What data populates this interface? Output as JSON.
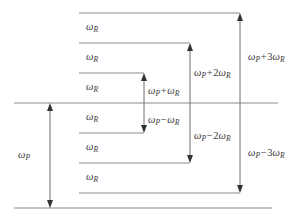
{
  "figure": {
    "type": "energy-level-diagram",
    "width": 302,
    "height": 220,
    "background_color": "#ffffff",
    "line_color": "#8c8c8c",
    "arrow_color": "#6e6e6e",
    "text_color": "#3a3a3a"
  },
  "symbols": {
    "omega": "ω",
    "sub_p": "P",
    "sub_r": "R",
    "plus": "+",
    "minus": "−"
  },
  "levels": [
    {
      "id": "level-p-plus-3r",
      "y": 13,
      "x1": 79,
      "x2": 240,
      "order": 1
    },
    {
      "id": "level-p-plus-2r",
      "y": 43,
      "x1": 79,
      "x2": 190,
      "order": 2
    },
    {
      "id": "level-p-plus-1r",
      "y": 73,
      "x1": 79,
      "x2": 144,
      "order": 3
    },
    {
      "id": "level-pump",
      "y": 103,
      "x1": 14,
      "x2": 278,
      "order": 4
    },
    {
      "id": "level-p-minus-1r",
      "y": 133,
      "x1": 79,
      "x2": 144,
      "order": 5
    },
    {
      "id": "level-p-minus-2r",
      "y": 163,
      "x1": 79,
      "x2": 190,
      "order": 6
    },
    {
      "id": "level-p-minus-3r",
      "y": 193,
      "x1": 79,
      "x2": 240,
      "order": 7
    },
    {
      "id": "level-ground",
      "y": 208,
      "x1": 14,
      "x2": 272,
      "order": 8
    }
  ],
  "gap_labels": [
    {
      "id": "gap-1",
      "base": "ω",
      "sub": "R",
      "x": 86,
      "y": 22
    },
    {
      "id": "gap-2",
      "base": "ω",
      "sub": "R",
      "x": 86,
      "y": 52
    },
    {
      "id": "gap-3",
      "base": "ω",
      "sub": "R",
      "x": 86,
      "y": 82
    },
    {
      "id": "gap-4",
      "base": "ω",
      "sub": "R",
      "x": 86,
      "y": 112
    },
    {
      "id": "gap-5",
      "base": "ω",
      "sub": "R",
      "x": 86,
      "y": 142
    },
    {
      "id": "gap-6",
      "base": "ω",
      "sub": "R",
      "x": 86,
      "y": 172
    }
  ],
  "arrows": [
    {
      "id": "arrow-omega-p",
      "x": 50,
      "y_top": 103,
      "y_bottom": 208,
      "head_top": true,
      "head_bottom": true,
      "label_id": "label-omega-p"
    },
    {
      "id": "arrow-omega-p-plus-r",
      "x": 144,
      "y_top": 73,
      "y_bottom": 103,
      "head_top": true,
      "head_bottom": false,
      "label_id": "label-omega-p-plus-r"
    },
    {
      "id": "arrow-omega-p-minus-r",
      "x": 144,
      "y_top": 103,
      "y_bottom": 133,
      "head_top": false,
      "head_bottom": true,
      "label_id": "label-omega-p-minus-r"
    },
    {
      "id": "arrow-omega-p-plus-2r",
      "x": 190,
      "y_top": 43,
      "y_bottom": 103,
      "head_top": true,
      "head_bottom": false,
      "label_id": "label-omega-p-plus-2r"
    },
    {
      "id": "arrow-omega-p-minus-2r",
      "x": 190,
      "y_top": 103,
      "y_bottom": 163,
      "head_top": false,
      "head_bottom": true,
      "label_id": "label-omega-p-minus-2r"
    },
    {
      "id": "arrow-omega-p-plus-3r",
      "x": 240,
      "y_top": 13,
      "y_bottom": 103,
      "head_top": true,
      "head_bottom": false,
      "label_id": "label-omega-p-plus-3r"
    },
    {
      "id": "arrow-omega-p-minus-3r",
      "x": 240,
      "y_top": 103,
      "y_bottom": 193,
      "head_top": false,
      "head_bottom": true,
      "label_id": "label-omega-p-minus-3r"
    }
  ],
  "labels": {
    "omega_p": {
      "text": "ω",
      "sub": "P",
      "full": "ωP",
      "x": 18,
      "y": 150
    },
    "omega_p_plus_r": {
      "base": "ω",
      "sub1": "P",
      "op": "+",
      "coeff": "",
      "base2": "ω",
      "sub2": "R",
      "full": "ωP + ωR",
      "x": 148,
      "y": 86
    },
    "omega_p_minus_r": {
      "base": "ω",
      "sub1": "P",
      "op": "−",
      "coeff": "",
      "base2": "ω",
      "sub2": "R",
      "full": "ωP − ωR",
      "x": 148,
      "y": 115
    },
    "omega_p_plus_2r": {
      "base": "ω",
      "sub1": "P",
      "op": "+",
      "coeff": "2",
      "base2": "ω",
      "sub2": "R",
      "full": "ωP + 2ωR",
      "x": 194,
      "y": 68
    },
    "omega_p_minus_2r": {
      "base": "ω",
      "sub1": "P",
      "op": "−",
      "coeff": "2",
      "base2": "ω",
      "sub2": "R",
      "full": "ωP − 2ωR",
      "x": 194,
      "y": 131
    },
    "omega_p_plus_3r": {
      "base": "ω",
      "sub1": "P",
      "op": "+",
      "coeff": "3",
      "base2": "ω",
      "sub2": "R",
      "full": "ωP + 3ωR",
      "x": 248,
      "y": 52
    },
    "omega_p_minus_3r": {
      "base": "ω",
      "sub1": "P",
      "op": "−",
      "coeff": "3",
      "base2": "ω",
      "sub2": "R",
      "full": "ωP − 3ωR",
      "x": 248,
      "y": 148
    }
  }
}
